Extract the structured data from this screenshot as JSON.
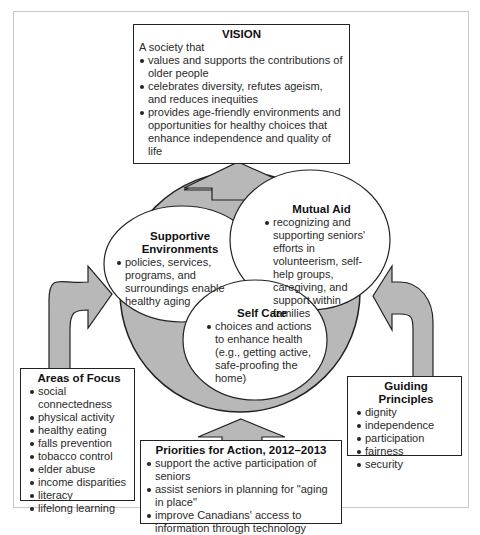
{
  "vision": {
    "title": "VISION",
    "intro": "A society that",
    "items": [
      "values and supports the contributions of older people",
      "celebrates diversity, refutes ageism, and reduces inequities",
      "provides age-friendly environments and opportunities for healthy choices that enhance independence and quality of life"
    ]
  },
  "supportive_environments": {
    "title_line1": "Supportive",
    "title_line2": "Environments",
    "items": [
      "policies, services, programs, and surroundings enable healthy aging"
    ]
  },
  "mutual_aid": {
    "title": "Mutual Aid",
    "items": [
      "recognizing and supporting seniors' efforts in volunteerism, self-help groups, caregiving, and support within families"
    ]
  },
  "self_care": {
    "title": "Self Care",
    "items": [
      "choices and actions to enhance health (e.g., getting active, safe-proofing the home)"
    ]
  },
  "areas_of_focus": {
    "title": "Areas of Focus",
    "items": [
      "social connectedness",
      "physical activity",
      "healthy eating",
      "falls prevention",
      "tobacco control",
      "elder abuse",
      "income disparities",
      "literacy",
      "lifelong learning"
    ]
  },
  "priorities": {
    "title": "Priorities for Action, 2012–2013",
    "items": [
      "support the active participation of seniors",
      "assist seniors in planning for \"aging in place\"",
      "improve Canadians' access to information through technology"
    ]
  },
  "guiding_principles": {
    "title": "Guiding Principles",
    "items": [
      "dignity",
      "independence",
      "participation",
      "fairness",
      "security"
    ]
  },
  "colors": {
    "shape_fill": "#b8b8b8",
    "outline": "#222222",
    "frame": "#c8c8c8"
  }
}
